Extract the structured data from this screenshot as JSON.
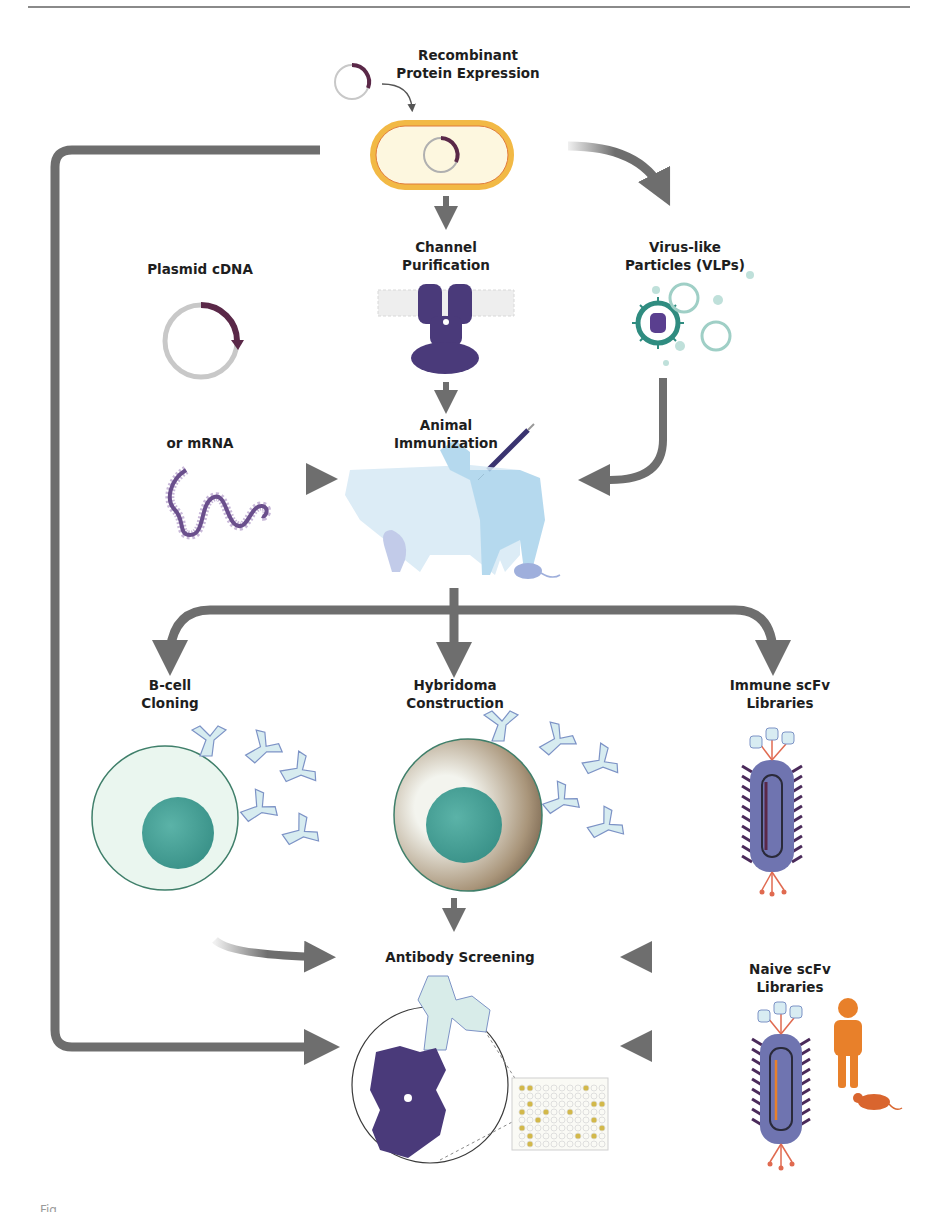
{
  "figure": {
    "colors": {
      "arrow": "#6e6e6e",
      "plasmid_backbone": "#c8c8c8",
      "plasmid_insert": "#5a2848",
      "channel_protein": "#4a3a7a",
      "bacterium_wall": "#f2b945",
      "bacterium_fill": "#fdf7df",
      "vlp": "#2f8c80",
      "animal_silhouette": "#a9d3ec",
      "bcell_fill": "#eaf6ef",
      "nucleus": "#3f9e95",
      "hybridoma_edge": "#8b7355",
      "phage_body": "#6f74b0",
      "phage_spikes": "#4a2a5a",
      "human_mouse": "#e8802a",
      "plate_hits": "#d2b84a"
    }
  },
  "nodes": {
    "recombinant": {
      "label": "Recombinant\nProtein Expression"
    },
    "plasmid": {
      "label": "Plasmid cDNA"
    },
    "mrna": {
      "label": "or mRNA"
    },
    "channel": {
      "label": "Channel\nPurification"
    },
    "vlp": {
      "label": "Virus-like\nParticles (VLPs)"
    },
    "immunization": {
      "label": "Animal\nImmunization"
    },
    "bcell": {
      "label": "B-cell\nCloning"
    },
    "hybridoma": {
      "label": "Hybridoma\nConstruction"
    },
    "immune_scfv": {
      "label": "Immune scFv\nLibraries"
    },
    "screening": {
      "label": "Antibody Screening"
    },
    "naive_scfv": {
      "label": "Naive scFv\nLibraries"
    }
  },
  "edges": [
    {
      "from": "plasmid",
      "to": "recombinant"
    },
    {
      "from": "recombinant",
      "to": "channel"
    },
    {
      "from": "recombinant",
      "to": "vlp"
    },
    {
      "from": "recombinant",
      "to": "screening"
    },
    {
      "from": "channel",
      "to": "immunization"
    },
    {
      "from": "vlp",
      "to": "immunization"
    },
    {
      "from": "mrna",
      "to": "immunization"
    },
    {
      "from": "immunization",
      "to": "bcell"
    },
    {
      "from": "immunization",
      "to": "hybridoma"
    },
    {
      "from": "immunization",
      "to": "immune_scfv"
    },
    {
      "from": "bcell",
      "to": "screening"
    },
    {
      "from": "hybridoma",
      "to": "screening"
    },
    {
      "from": "immune_scfv",
      "to": "screening"
    },
    {
      "from": "naive_scfv",
      "to": "screening"
    }
  ],
  "caption": {
    "text": "Fig."
  }
}
